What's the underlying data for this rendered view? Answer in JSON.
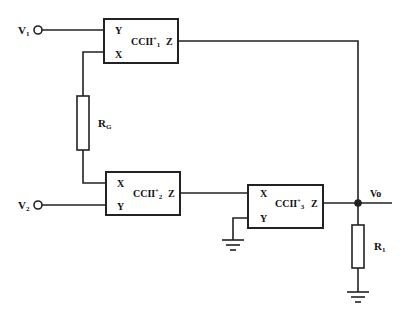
{
  "diagram": {
    "type": "circuit-schematic",
    "inputs": [
      {
        "id": "v1",
        "label": "V",
        "sub": "1"
      },
      {
        "id": "v2",
        "label": "V",
        "sub": "2"
      }
    ],
    "output": {
      "label": "Vo"
    },
    "blocks": [
      {
        "id": "ccii1",
        "name": "CCII",
        "sup": "+",
        "sub": "1",
        "ports": {
          "top": "Y",
          "bottom": "X",
          "out": "Z"
        }
      },
      {
        "id": "ccii2",
        "name": "CCII",
        "sup": "+",
        "sub": "2",
        "ports": {
          "top": "X",
          "bottom": "Y",
          "out": "Z"
        }
      },
      {
        "id": "ccii3",
        "name": "CCII",
        "sup": "+",
        "sub": "3",
        "ports": {
          "top": "X",
          "bottom": "Y",
          "out": "Z"
        }
      }
    ],
    "resistors": [
      {
        "id": "rg",
        "label": "R",
        "sub": "G"
      },
      {
        "id": "r1",
        "label": "R",
        "sub": "1"
      }
    ],
    "colors": {
      "line": "#222222",
      "background": "#ffffff"
    }
  }
}
